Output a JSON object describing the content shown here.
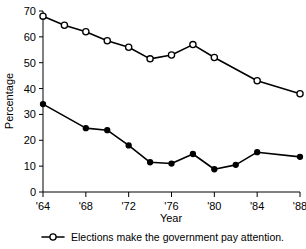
{
  "chart_data": {
    "type": "line",
    "title": "",
    "xlabel": "Year",
    "ylabel": "Percentage",
    "x": [
      1964,
      1966,
      1968,
      1970,
      1972,
      1974,
      1976,
      1978,
      1980,
      1982,
      1984,
      1986,
      1988
    ],
    "xlim": [
      1964,
      1988
    ],
    "ylim": [
      0,
      70
    ],
    "grid": false,
    "legend_position": "below-axes",
    "y_ticks": [
      0,
      10,
      20,
      30,
      40,
      50,
      60,
      70
    ],
    "y_tick_labels": [
      "0",
      "10",
      "20",
      "30",
      "40",
      "50",
      "60",
      "70"
    ],
    "x_ticks": [
      1964,
      1968,
      1972,
      1976,
      1980,
      1984,
      1988
    ],
    "x_tick_labels": [
      "'64",
      "'68",
      "'72",
      "'76",
      "'80",
      "'84",
      "'88"
    ],
    "series": [
      {
        "name": "Elections make the government pay attention.",
        "marker": "open-circle",
        "in_legend": true,
        "points": [
          {
            "x": 1964,
            "y": 68.0
          },
          {
            "x": 1966,
            "y": 64.5
          },
          {
            "x": 1968,
            "y": 62.0
          },
          {
            "x": 1970,
            "y": 58.5
          },
          {
            "x": 1972,
            "y": 56.0
          },
          {
            "x": 1974,
            "y": 51.5
          },
          {
            "x": 1976,
            "y": 53.0
          },
          {
            "x": 1978,
            "y": 57.0
          },
          {
            "x": 1980,
            "y": 52.0
          },
          {
            "x": 1984,
            "y": 43.0
          },
          {
            "x": 1988,
            "y": 38.0
          }
        ]
      },
      {
        "name": "",
        "marker": "filled-circle",
        "in_legend": false,
        "points": [
          {
            "x": 1964,
            "y": 34.0
          },
          {
            "x": 1968,
            "y": 24.7
          },
          {
            "x": 1970,
            "y": 23.9
          },
          {
            "x": 1972,
            "y": 18.0
          },
          {
            "x": 1974,
            "y": 11.5
          },
          {
            "x": 1976,
            "y": 11.0
          },
          {
            "x": 1978,
            "y": 14.7
          },
          {
            "x": 1980,
            "y": 8.8
          },
          {
            "x": 1982,
            "y": 10.5
          },
          {
            "x": 1984,
            "y": 15.4
          },
          {
            "x": 1988,
            "y": 13.6
          }
        ]
      }
    ]
  },
  "legend": {
    "entries": [
      {
        "label": "Elections make the government pay attention.",
        "marker": "open-circle"
      }
    ]
  },
  "axes": {
    "y_title": "Percentage",
    "x_title": "Year"
  }
}
